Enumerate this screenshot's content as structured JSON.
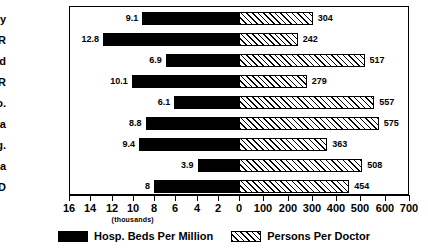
{
  "chart_data": {
    "type": "bar",
    "orientation": "horizontal",
    "style": "bidirectional-population-pyramid",
    "title": "",
    "xlabel": "",
    "ylabel": "",
    "unit_note": "(thousands)",
    "categories": [
      "Hungary",
      "X-USSR",
      "Poland",
      "CSFR",
      "Yugo.",
      "Romania",
      "Bulg.",
      "Albania",
      "OECD"
    ],
    "series": [
      {
        "name": "Hosp. Beds Per Million",
        "direction": "left",
        "color": "#000000",
        "fill": "solid",
        "axis_ticks": [
          16,
          14,
          12,
          10,
          8,
          6,
          4,
          2,
          0
        ],
        "axis_min": 0,
        "axis_max": 16,
        "unit": "thousands",
        "values": [
          9.1,
          12.8,
          6.9,
          10.1,
          6.1,
          8.8,
          9.4,
          3.9,
          8
        ],
        "labels": [
          "9.1",
          "12.8",
          "6.9",
          "10.1",
          "6.1",
          "8.8",
          "9.4",
          "3.9",
          "8"
        ]
      },
      {
        "name": "Persons Per Doctor",
        "direction": "right",
        "color": "#ffffff",
        "fill": "diagonal-hatch",
        "axis_ticks": [
          0,
          100,
          200,
          300,
          400,
          500,
          600,
          700
        ],
        "axis_min": 0,
        "axis_max": 700,
        "unit": "persons",
        "values": [
          304,
          242,
          517,
          279,
          557,
          575,
          363,
          508,
          454
        ],
        "labels": [
          "304",
          "242",
          "517",
          "279",
          "557",
          "575",
          "363",
          "508",
          "454"
        ]
      }
    ],
    "legend": {
      "position": "bottom-center",
      "entries": [
        {
          "label": "Hosp. Beds Per Million",
          "fill": "solid",
          "color": "#000000"
        },
        {
          "label": "Persons Per Doctor",
          "fill": "diagonal-hatch",
          "color": "#ffffff"
        }
      ]
    },
    "grid": false,
    "frame": true
  }
}
